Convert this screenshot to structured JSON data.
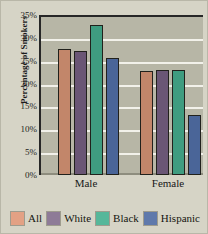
{
  "chart_data": {
    "type": "bar",
    "title": "",
    "xlabel": "",
    "ylabel": "Percentage of Smokers",
    "categories": [
      "Male",
      "Female"
    ],
    "series": [
      {
        "name": "All",
        "values": [
          27.5,
          22.8
        ],
        "color": "#c2866a",
        "legend_color": "#e3a184"
      },
      {
        "name": "White",
        "values": [
          27.1,
          23.0
        ],
        "color": "#6a5675",
        "legend_color": "#8e7b97"
      },
      {
        "name": "Black",
        "values": [
          32.9,
          23.0
        ],
        "color": "#3f9c80",
        "legend_color": "#56b79a"
      },
      {
        "name": "Hispanic",
        "values": [
          25.5,
          13.2
        ],
        "color": "#4a6598",
        "legend_color": "#5f79ab"
      }
    ],
    "ylim": [
      0,
      35
    ],
    "ytick_values": [
      0,
      5,
      10,
      15,
      20,
      25,
      30,
      35
    ],
    "ytick_labels": [
      "0%",
      "5%",
      "10%",
      "15%",
      "20%",
      "25%",
      "30%",
      "35%"
    ],
    "grid": true,
    "grid_axis": "y",
    "legend_position": "bottom",
    "colors": {
      "figure_background": "#d6d4c6",
      "plot_background": "#b7b6a6",
      "gridline": "#f2f1ea",
      "axis": "#272727",
      "bar_outline": "#21211c",
      "text": "#1b1b1b"
    }
  }
}
